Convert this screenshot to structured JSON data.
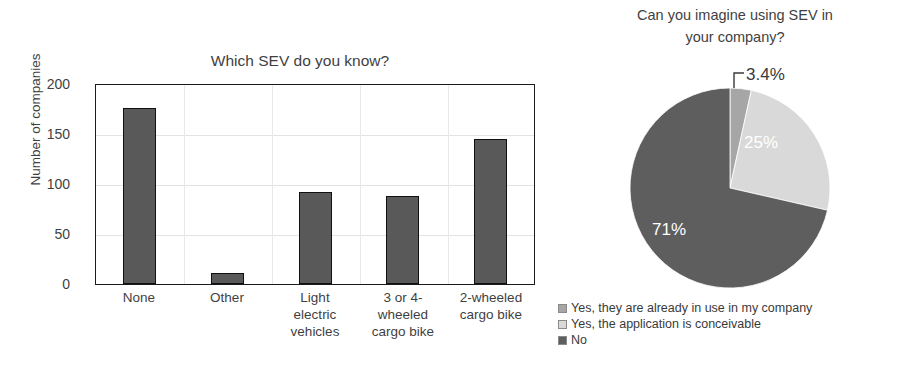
{
  "chart_data": [
    {
      "type": "bar",
      "title": "Which SEV do you know?",
      "xlabel": "",
      "ylabel": "Number of companies",
      "categories": [
        "None",
        "Other",
        "Light electric vehicles",
        "3 or 4-wheeled cargo bike",
        "2-wheeled cargo bike"
      ],
      "category_lines": [
        [
          "None"
        ],
        [
          "Other"
        ],
        [
          "Light",
          "electric",
          "vehicles"
        ],
        [
          "3 or 4-",
          "wheeled",
          "cargo bike"
        ],
        [
          "2-wheeled",
          "cargo bike"
        ]
      ],
      "values": [
        177,
        11,
        92,
        88,
        146
      ],
      "ylim": [
        0,
        200
      ],
      "yticks": [
        0,
        50,
        100,
        150,
        200
      ],
      "grid": "horizontal-and-vertical",
      "bar_color": "#595959",
      "bar_border_color": "#111111"
    },
    {
      "type": "pie",
      "title": "Can you imagine using SEV in your company?",
      "title_lines": [
        "Can you imagine using SEV in",
        "your company?"
      ],
      "labels": [
        "Yes, they are already in use in my company",
        "Yes, the application is conceivable",
        "No"
      ],
      "values": [
        3.4,
        25,
        71
      ],
      "display_values": [
        "3.4%",
        "25%",
        "71%"
      ],
      "colors": [
        "#a6a6a6",
        "#d9d9d9",
        "#5e5e5e"
      ],
      "legend_position": "bottom-left",
      "start_angle_deg": 0,
      "direction": "clockwise"
    }
  ],
  "bar_chart": {
    "title": "Which SEV do you know?",
    "ylabel": "Number of companies",
    "yticks": [
      "200",
      "150",
      "100",
      "50",
      "0"
    ],
    "categories": [
      {
        "lines": [
          "None"
        ],
        "value": 177
      },
      {
        "lines": [
          "Other"
        ],
        "value": 11
      },
      {
        "lines": [
          "Light",
          "electric",
          "vehicles"
        ],
        "value": 92
      },
      {
        "lines": [
          "3 or 4-",
          "wheeled",
          "cargo bike"
        ],
        "value": 88
      },
      {
        "lines": [
          "2-wheeled",
          "cargo bike"
        ],
        "value": 146
      }
    ]
  },
  "pie_chart": {
    "title_line1": "Can you imagine using SEV in",
    "title_line2": "your company?",
    "callout_label": "3.4%",
    "slice_labels": [
      "25%",
      "71%"
    ],
    "legend": [
      {
        "label": "Yes, they are already in use in my company",
        "color": "#a6a6a6"
      },
      {
        "label": "Yes, the application is conceivable",
        "color": "#d9d9d9"
      },
      {
        "label": "No",
        "color": "#5e5e5e"
      }
    ]
  }
}
